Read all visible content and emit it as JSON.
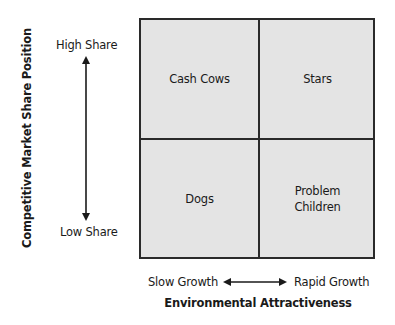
{
  "diagram": {
    "type": "2x2 matrix",
    "y_axis": {
      "title": "Competitive Market Share Position",
      "high_label": "High Share",
      "low_label": "Low Share"
    },
    "x_axis": {
      "title": "Environmental Attractiveness",
      "low_label": "Slow Growth",
      "high_label": "Rapid Growth"
    },
    "quadrants": {
      "top_left": "Cash Cows",
      "top_right": "Stars",
      "bottom_left": "Dogs",
      "bottom_right": "Problem\nChildren"
    },
    "colors": {
      "quadrant_fill": "#e4e4e4",
      "border": "#2a2a2a",
      "text": "#1a1a1a"
    }
  }
}
